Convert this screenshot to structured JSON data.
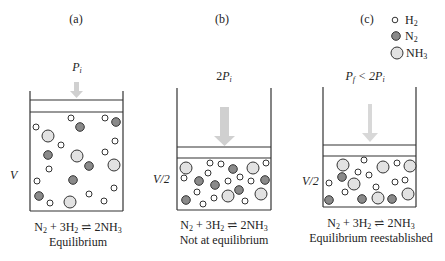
{
  "panels": [
    {
      "label": "(a)",
      "pressure": {
        "prefix": "",
        "var": "P",
        "sub": "i",
        "suffix": ""
      },
      "volume_label": "V",
      "equation": {
        "lhs1": "N",
        "lhs1_sub": "2",
        "plus": " + 3H",
        "lhs2_sub": "2",
        "arrow": " ⇌ ",
        "rhs": "2NH",
        "rhs_sub": "3"
      },
      "caption": "Equilibrium"
    },
    {
      "label": "(b)",
      "pressure": {
        "prefix": "2",
        "var": "P",
        "sub": "i",
        "suffix": ""
      },
      "volume_label": "V/2",
      "equation": {
        "lhs1": "N",
        "lhs1_sub": "2",
        "plus": " + 3H",
        "lhs2_sub": "2",
        "arrow": " ⇌ ",
        "rhs": "2NH",
        "rhs_sub": "3"
      },
      "caption": "Not at equilibrium"
    },
    {
      "label": "(c)",
      "pressure": {
        "prefix": "",
        "var": "P",
        "sub": "f",
        "suffix": " < 2P",
        "suffix_sub": "i"
      },
      "volume_label": "V/2",
      "equation": {
        "lhs1": "N",
        "lhs1_sub": "2",
        "plus": " + 3H",
        "lhs2_sub": "2",
        "arrow": " ⇌ ",
        "rhs": "2NH",
        "rhs_sub": "3"
      },
      "caption": "Equilibrium reestablished"
    }
  ],
  "legend": [
    {
      "species": "H",
      "sub": "2",
      "marker": "small-white-circle"
    },
    {
      "species": "N",
      "sub": "2",
      "marker": "dark-gray-circle"
    },
    {
      "species": "NH",
      "sub": "3",
      "marker": "large-light-gray-circle"
    }
  ],
  "colors": {
    "h2_fill": "#ffffff",
    "n2_fill": "#8a8a8a",
    "nh3_fill": "#e2e2e2",
    "outline": "#333333",
    "arrow": "#cfcfcf"
  }
}
